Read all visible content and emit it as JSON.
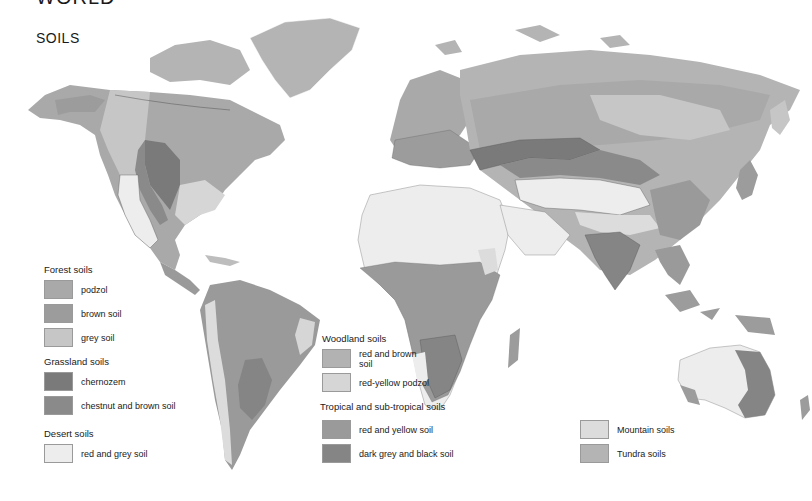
{
  "header": {
    "title": "WORLD",
    "subtitle": "SOILS"
  },
  "colors": {
    "podzol": "#a9a9a9",
    "brown_soil": "#9c9c9c",
    "grey_soil": "#c6c6c6",
    "chernozem": "#7a7a7a",
    "chestnut_brown": "#8a8a8a",
    "desert_red_grey": "#ededed",
    "woodland_red_brown": "#b2b2b2",
    "red_yellow_podzol": "#d6d6d6",
    "tropical_red_yellow": "#9a9a9a",
    "dark_grey_black": "#858585",
    "mountain": "#dcdcdc",
    "tundra": "#b4b4b4",
    "border": "#555555"
  },
  "legend": {
    "forest": {
      "heading": "Forest soils",
      "items": [
        {
          "label": "podzol",
          "color": "#a9a9a9"
        },
        {
          "label": "brown soil",
          "color": "#9c9c9c"
        },
        {
          "label": "grey soil",
          "color": "#c6c6c6"
        }
      ]
    },
    "grassland": {
      "heading": "Grassland soils",
      "items": [
        {
          "label": "chernozem",
          "color": "#7a7a7a"
        },
        {
          "label": "chestnut and brown soil",
          "color": "#8a8a8a"
        }
      ]
    },
    "desert": {
      "heading": "Desert soils",
      "items": [
        {
          "label": "red and grey soil",
          "color": "#ededed"
        }
      ]
    },
    "woodland": {
      "heading": "Woodland soils",
      "items": [
        {
          "label": "red and brown soil",
          "color": "#b2b2b2"
        },
        {
          "label": "red-yellow podzol",
          "color": "#d6d6d6"
        }
      ]
    },
    "tropical": {
      "heading": "Tropical and sub-tropical soils",
      "items": [
        {
          "label": "red and yellow soil",
          "color": "#9a9a9a"
        },
        {
          "label": "dark grey and black soil",
          "color": "#858585"
        }
      ]
    },
    "other": {
      "items": [
        {
          "label": "Mountain soils",
          "color": "#dcdcdc"
        },
        {
          "label": "Tundra soils",
          "color": "#b4b4b4"
        }
      ]
    }
  }
}
